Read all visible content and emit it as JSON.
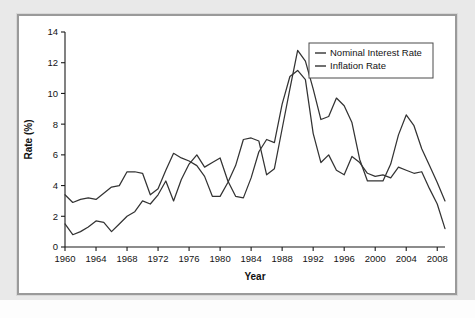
{
  "figure": {
    "panel_background": "#ffffff",
    "outer_background": "#e9e9e9",
    "border_color": "#9a9a9a"
  },
  "chart_data": {
    "type": "line",
    "title": "",
    "subtitle": "",
    "xlabel": "Year",
    "ylabel": "Rate (%)",
    "xlim": [
      1960,
      2009
    ],
    "ylim": [
      0,
      14
    ],
    "xticks": [
      1960,
      1964,
      1968,
      1972,
      1976,
      1980,
      1984,
      1988,
      1992,
      1996,
      2000,
      2004,
      2008
    ],
    "yticks": [
      0,
      2,
      4,
      6,
      8,
      10,
      12,
      14
    ],
    "grid": false,
    "legend_position": "top-right",
    "x": [
      1960,
      1961,
      1962,
      1963,
      1964,
      1965,
      1966,
      1967,
      1968,
      1969,
      1970,
      1971,
      1972,
      1973,
      1974,
      1975,
      1976,
      1977,
      1978,
      1979,
      1980,
      1981,
      1982,
      1983,
      1984,
      1985,
      1986,
      1987,
      1988,
      1989,
      1990,
      1991,
      1992,
      1993,
      1994,
      1995,
      1996,
      1997,
      1998,
      1999,
      2000,
      2001,
      2002,
      2003,
      2004,
      2005,
      2006,
      2007,
      2008,
      2009
    ],
    "series": [
      {
        "name": "Nominal Interest Rate",
        "color": "#333333",
        "values": [
          3.4,
          2.9,
          3.1,
          3.2,
          3.1,
          3.5,
          3.9,
          4.0,
          4.9,
          4.9,
          4.8,
          3.4,
          3.8,
          5.0,
          6.1,
          5.8,
          5.6,
          5.3,
          4.6,
          3.3,
          3.3,
          4.2,
          5.3,
          7.0,
          7.1,
          6.9,
          4.7,
          5.1,
          7.7,
          10.3,
          12.8,
          12.1,
          10.3,
          8.3,
          8.5,
          9.7,
          9.2,
          8.1,
          5.7,
          4.3,
          4.3,
          4.3,
          5.4,
          7.3,
          8.6,
          7.9,
          6.4,
          5.3,
          4.2,
          3.0
        ]
      },
      {
        "name": "Inflation Rate",
        "color": "#333333",
        "values": [
          1.5,
          0.8,
          1.0,
          1.3,
          1.7,
          1.6,
          1.0,
          1.5,
          2.0,
          2.3,
          3.0,
          2.8,
          3.4,
          4.3,
          3.0,
          4.4,
          5.4,
          6.0,
          5.2,
          5.5,
          5.8,
          4.3,
          3.3,
          3.2,
          4.5,
          6.2,
          7.0,
          6.8,
          9.3,
          11.1,
          11.5,
          10.9,
          7.4,
          5.5,
          6.0,
          5.0,
          4.7,
          5.9,
          5.5,
          4.8,
          4.6,
          4.7,
          4.5,
          5.2,
          5.0,
          4.8,
          4.9,
          3.8,
          2.8,
          1.2
        ]
      }
    ],
    "series_late_segments": [
      {
        "name": "Nominal Interest Rate",
        "note": "1984-2009 path descending from ~8.5 to 0 at 2009"
      },
      {
        "name": "Inflation Rate",
        "note": "1984-2009 path descending from ~4.3 to 0 at 2009"
      }
    ],
    "nominal_points": "1960:3.4 1961:2.9 1962:3.1 1963:3.1 1964:3.0 1965:3.4 1966:3.8 1967:3.9 1968:4.9 1969:4.9 1970:4.8 1971:3.4 1972:4.0 1973:5.0 1974:6.1 1975:5.7 1976:5.5 1977:5.3 1978:4.5 1979:3.3 1980:3.3 1981:3.3 1982:4.3 1983:4.6 1984:7.0 1985:7.1 1986:7.1 1987:4.7 1988:5.1 1989:7.7 1990:10.3 1991:12.8 1992:12.1 1993:10.3 1994:8.3 1995:8.5 1996:9.7 1997:9.2 1998:8.1 1999:5.7 2000:4.3 2001:4.3 2002:4.3 2003:5.4 2004:7.3 2005:8.6",
    "annotations": []
  },
  "legend": {
    "entries": [
      {
        "label": "Nominal Interest Rate",
        "color": "#333333"
      },
      {
        "label": "Inflation Rate",
        "color": "#333333"
      }
    ]
  },
  "axes": {
    "y_title": "Rate (%)",
    "x_title": "Year",
    "y_tick_labels": [
      "0",
      "2",
      "4",
      "6",
      "8",
      "10",
      "12",
      "14"
    ],
    "x_tick_labels": [
      "1960",
      "1964",
      "1968",
      "1972",
      "1976",
      "1980",
      "1984",
      "1988",
      "1992",
      "1996",
      "2000",
      "2004",
      "2008"
    ]
  }
}
